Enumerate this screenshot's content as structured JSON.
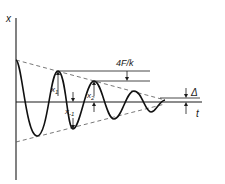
{
  "diagram": {
    "type": "damped oscillation with Coulomb friction",
    "axes": {
      "y_label": "x",
      "x_label": "t"
    },
    "labels": {
      "x1": "x",
      "x1_sub": "1",
      "x_minus1": "x",
      "x_minus1_sub": "-1",
      "x2": "x",
      "x2_sub": "2",
      "decrement": "4F/k",
      "dead_zone": "Δ"
    },
    "colors": {
      "ink": "#111111",
      "envelope": "#555555",
      "background": "#ffffff"
    }
  }
}
